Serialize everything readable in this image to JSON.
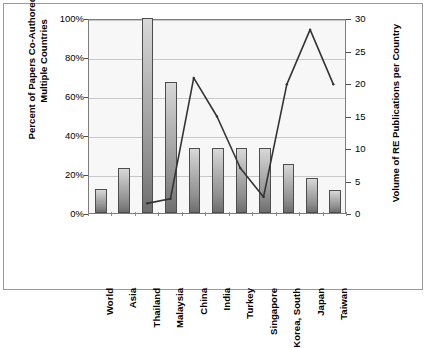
{
  "chart_data": {
    "type": "bar",
    "title": "",
    "subtitle": "",
    "categories": [
      "World",
      "Asia",
      "Thailand",
      "Malaysia",
      "China",
      "India",
      "Turkey",
      "Singapore",
      "Korea, South",
      "Japan",
      "Taiwan"
    ],
    "xlabel": "",
    "grid": true,
    "legend": "none",
    "series": [
      {
        "name": "Percent of Papers Co-Authored by Multiple Countries",
        "type": "bar",
        "axis": "left",
        "values": [
          12.5,
          23,
          100,
          67,
          33.3,
          33.3,
          33.3,
          33.3,
          25,
          18,
          12
        ],
        "value_labels": [
          "12.5%",
          "23%",
          "100%",
          "67%",
          "33%",
          "33%",
          "33%",
          "33%",
          "25%",
          "18%",
          "12%"
        ]
      },
      {
        "name": "Volume of RE Publications per Country",
        "type": "line",
        "axis": "right",
        "values": [
          null,
          null,
          1.5,
          2.2,
          21,
          15,
          7,
          2.5,
          20,
          28.5,
          20
        ],
        "value_labels": [
          "",
          "",
          "1.5",
          "2.2",
          "21",
          "15",
          "7",
          "2.5",
          "20",
          "28.5",
          "20"
        ]
      }
    ],
    "yaxis_left": {
      "label": "Percent of Papers Co-Authored by Multiple Countries",
      "ticks": [
        "0%",
        "20%",
        "40%",
        "60%",
        "80%",
        "100%"
      ],
      "tick_values": [
        0,
        20,
        40,
        60,
        80,
        100
      ],
      "ylim": [
        0,
        100
      ]
    },
    "yaxis_right": {
      "label": "Volume of RE Publications per Country",
      "ticks": [
        "0",
        "5",
        "10",
        "15",
        "20",
        "25",
        "30"
      ],
      "tick_values": [
        0,
        5,
        10,
        15,
        20,
        25,
        30
      ],
      "ylim": [
        0,
        30
      ]
    }
  },
  "colors": {
    "bar_top": "#d8d8d8",
    "bar_bottom": "#6e6e6e",
    "bar_border": "#4d4d4d",
    "line": "#333333",
    "plot_background": "#f7f7f7",
    "gridline": "#c8c8c8",
    "frame": "#9a9a9a",
    "text": "#000000"
  }
}
